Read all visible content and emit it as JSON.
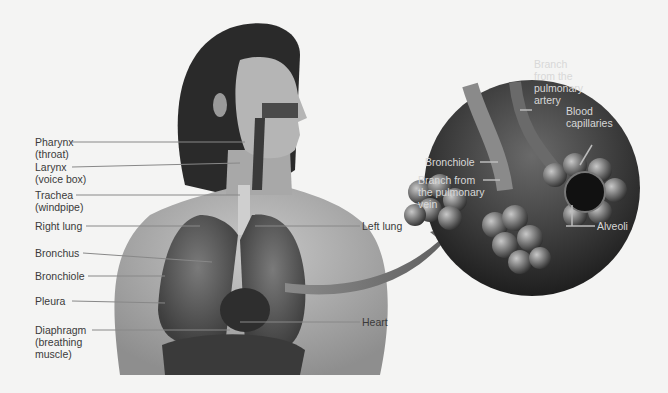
{
  "figure": {
    "left_labels": [
      {
        "id": "pharynx",
        "text": "Pharynx\n(throat)"
      },
      {
        "id": "larynx",
        "text": "Larynx\n(voice box)"
      },
      {
        "id": "trachea",
        "text": "Trachea\n(windpipe)"
      },
      {
        "id": "right-lung",
        "text": "Right lung"
      },
      {
        "id": "bronchus",
        "text": "Bronchus"
      },
      {
        "id": "bronchiole",
        "text": "Bronchiole"
      },
      {
        "id": "pleura",
        "text": "Pleura"
      },
      {
        "id": "diaphragm",
        "text": "Diaphragm\n(breathing\nmuscle)"
      }
    ],
    "right_labels": [
      {
        "id": "left-lung",
        "text": "Left lung"
      },
      {
        "id": "heart",
        "text": "Heart"
      }
    ],
    "inset": {
      "labels": [
        {
          "id": "branch-artery",
          "text": "Branch\nfrom the\npulmonary\nartery"
        },
        {
          "id": "inset-bronchiole",
          "text": "Bronchiole"
        },
        {
          "id": "branch-vein",
          "text": "Branch from\nthe pulmonary\nvein"
        },
        {
          "id": "capillaries",
          "text": "Blood\ncapillaries"
        },
        {
          "id": "alveoli",
          "text": "Alveoli"
        }
      ]
    }
  }
}
